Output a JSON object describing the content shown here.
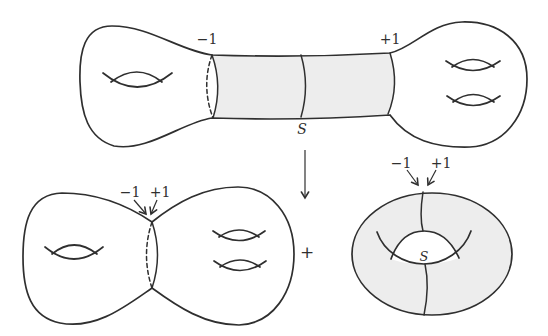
{
  "colors": {
    "stroke": "#2f2f2f",
    "shade": "#ededed",
    "background": "#ffffff"
  },
  "top_surface": {
    "left_circle_label": "−1",
    "right_circle_label": "+1",
    "middle_circle_label": "S"
  },
  "operators": {
    "plus": "+"
  },
  "pinched_surface": {
    "left_label": "−1",
    "right_label": "+1"
  },
  "torus": {
    "left_label": "−1",
    "right_label": "+1",
    "circle_label": "S"
  }
}
